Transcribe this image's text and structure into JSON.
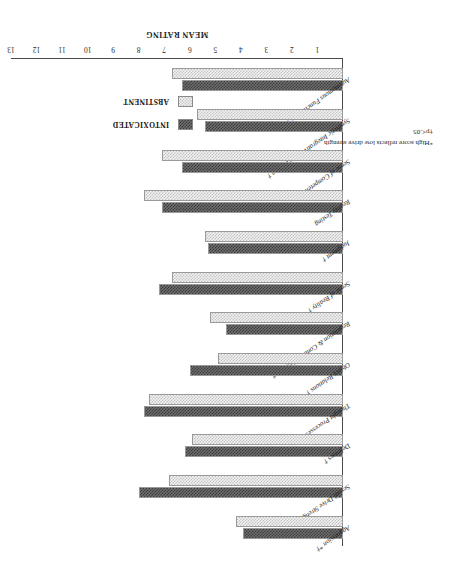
{
  "chart_data": {
    "type": "bar",
    "orientation": "horizontal",
    "title": "",
    "xlabel": "MEAN RATING",
    "ylabel": "",
    "xlim": [
      0,
      13
    ],
    "xticks": [
      "1",
      "2",
      "3",
      "4",
      "5",
      "6",
      "7",
      "8",
      "9",
      "10",
      "11",
      "12",
      "13"
    ],
    "grid": false,
    "legend_position": "upper-right",
    "categories": [
      "Autonomous Functioning †",
      "Synthetic Integrative Functioning †",
      "Sense of Competence †",
      "Reality Testing",
      "Judgment †",
      "Sense of Reality †",
      "Regulation & Control of Drives †",
      "Object Relations †",
      "Thought Processes †",
      "Defenses †",
      "Sexual Drive Strength *",
      "Aggression *†"
    ],
    "series": [
      {
        "name": "INTOXICATED",
        "color": "#3a3a3a",
        "values": [
          6.3,
          5.4,
          6.3,
          7.1,
          5.3,
          7.2,
          4.6,
          6.0,
          7.8,
          6.2,
          8.0,
          3.9
        ]
      },
      {
        "name": "ABSTINENT",
        "color": "#c2c2c2",
        "values": [
          6.7,
          5.7,
          7.1,
          7.8,
          5.4,
          6.7,
          5.2,
          4.9,
          7.6,
          5.9,
          6.8,
          4.2
        ]
      }
    ]
  },
  "legend": {
    "items": [
      {
        "label": "INTOXICATED",
        "swatch": "dark-checker-swatch"
      },
      {
        "label": "ABSTINENT",
        "swatch": "light-checker-swatch"
      }
    ]
  },
  "footnotes": [
    "*High score reflects low drive strength",
    "†p<.05"
  ],
  "axis": {
    "value_axis_title": "MEAN RATING"
  }
}
